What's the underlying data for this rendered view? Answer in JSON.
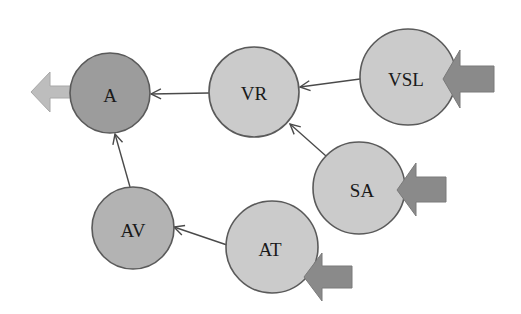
{
  "diagram": {
    "type": "directed-graph",
    "colors": {
      "background": "#ffffff",
      "node_light": "#cbcbcb",
      "node_medium": "#b3b3b3",
      "node_dark": "#9c9c9c",
      "node_stroke": "#5a5a5a",
      "edge": "#4a4a4a",
      "input_arrow": "#8a8a8a",
      "output_arrow": "#bdbdbd"
    },
    "nodes": [
      {
        "id": "A",
        "label": "A",
        "cx": 110,
        "cy": 93,
        "r": 40,
        "fill": "#9c9c9c"
      },
      {
        "id": "VR",
        "label": "VR",
        "cx": 254,
        "cy": 92,
        "r": 45,
        "fill": "#cbcbcb"
      },
      {
        "id": "VSL",
        "label": "VSL",
        "cx": 408,
        "cy": 77,
        "r": 48,
        "fill": "#cbcbcb"
      },
      {
        "id": "SA",
        "label": "SA",
        "cx": 359,
        "cy": 188,
        "r": 46,
        "fill": "#cbcbcb"
      },
      {
        "id": "AV",
        "label": "AV",
        "cx": 133,
        "cy": 228,
        "r": 41,
        "fill": "#b3b3b3"
      },
      {
        "id": "AT",
        "label": "AT",
        "cx": 272,
        "cy": 247,
        "r": 46,
        "fill": "#cbcbcb"
      }
    ],
    "edges": [
      {
        "from": "VR",
        "to": "A"
      },
      {
        "from": "VSL",
        "to": "VR"
      },
      {
        "from": "SA",
        "to": "VR"
      },
      {
        "from": "AV",
        "to": "A"
      },
      {
        "from": "AT",
        "to": "AV"
      }
    ],
    "inputs": [
      {
        "target": "VSL",
        "direction": "from-right"
      },
      {
        "target": "SA",
        "direction": "from-right"
      },
      {
        "target": "AT",
        "direction": "from-right"
      }
    ],
    "outputs": [
      {
        "source": "A",
        "direction": "to-left"
      }
    ]
  }
}
